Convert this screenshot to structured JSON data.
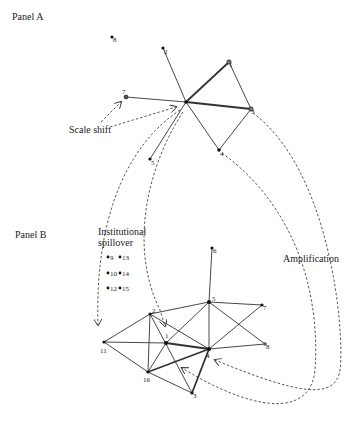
{
  "panels": {
    "a": {
      "label": "Panel A"
    },
    "b": {
      "label": "Panel B"
    }
  },
  "annotations": {
    "scale_shift": "Scale shift",
    "institutional_spillover_line1": "Institutional",
    "institutional_spillover_line2": "spillover",
    "amplification": "Amplification"
  },
  "panel_a": {
    "nodes": [
      {
        "id": "hub",
        "label": "",
        "x": 186,
        "y": 102
      },
      {
        "id": "8",
        "label": "8",
        "x": 112,
        "y": 37
      },
      {
        "id": "2",
        "label": "2",
        "x": 163,
        "y": 48
      },
      {
        "id": "7",
        "label": "7",
        "x": 126,
        "y": 97
      },
      {
        "id": "1",
        "label": "1",
        "x": 229,
        "y": 62
      },
      {
        "id": "3",
        "label": "3",
        "x": 251,
        "y": 109
      },
      {
        "id": "4",
        "label": "4",
        "x": 219,
        "y": 150
      },
      {
        "id": "5",
        "label": "5",
        "x": 150,
        "y": 159
      }
    ],
    "edges": [
      {
        "from": "hub",
        "to": "2",
        "weight": 1
      },
      {
        "from": "hub",
        "to": "7",
        "weight": 1
      },
      {
        "from": "hub",
        "to": "1",
        "weight": 2
      },
      {
        "from": "hub",
        "to": "3",
        "weight": 2.2
      },
      {
        "from": "hub",
        "to": "4",
        "weight": 1
      },
      {
        "from": "hub",
        "to": "5",
        "weight": 1
      },
      {
        "from": "1",
        "to": "3",
        "weight": 1
      },
      {
        "from": "3",
        "to": "4",
        "weight": 1
      }
    ]
  },
  "panel_b": {
    "isolated_nodes": [
      {
        "id": "9",
        "label": "9",
        "x": 108,
        "y": 257
      },
      {
        "id": "13",
        "label": "13",
        "x": 120,
        "y": 257
      },
      {
        "id": "10",
        "label": "10",
        "x": 108,
        "y": 273
      },
      {
        "id": "14",
        "label": "14",
        "x": 120,
        "y": 273
      },
      {
        "id": "12",
        "label": "12",
        "x": 108,
        "y": 288
      },
      {
        "id": "15",
        "label": "15",
        "x": 120,
        "y": 288
      }
    ],
    "nodes": [
      {
        "id": "6",
        "label": "6",
        "x": 212,
        "y": 248
      },
      {
        "id": "5",
        "label": "5",
        "x": 209,
        "y": 302
      },
      {
        "id": "7",
        "label": "7",
        "x": 262,
        "y": 305
      },
      {
        "id": "2",
        "label": "2",
        "x": 150,
        "y": 314
      },
      {
        "id": "1",
        "label": "1",
        "x": 166,
        "y": 343
      },
      {
        "id": "11",
        "label": "11",
        "x": 104,
        "y": 342
      },
      {
        "id": "4",
        "label": "4",
        "x": 209,
        "y": 349
      },
      {
        "id": "8",
        "label": "8",
        "x": 265,
        "y": 344
      },
      {
        "id": "16",
        "label": "16",
        "x": 148,
        "y": 372
      },
      {
        "id": "3",
        "label": "3",
        "x": 192,
        "y": 393
      }
    ],
    "edges": [
      {
        "from": "6",
        "to": "5",
        "weight": 1
      },
      {
        "from": "5",
        "to": "7",
        "weight": 1
      },
      {
        "from": "5",
        "to": "8",
        "weight": 1
      },
      {
        "from": "5",
        "to": "2",
        "weight": 1
      },
      {
        "from": "5",
        "to": "1",
        "weight": 1
      },
      {
        "from": "5",
        "to": "4",
        "weight": 1
      },
      {
        "from": "7",
        "to": "4",
        "weight": 1
      },
      {
        "from": "8",
        "to": "4",
        "weight": 1
      },
      {
        "from": "2",
        "to": "11",
        "weight": 1
      },
      {
        "from": "2",
        "to": "16",
        "weight": 1
      },
      {
        "from": "2",
        "to": "3",
        "weight": 1
      },
      {
        "from": "2",
        "to": "4",
        "weight": 1
      },
      {
        "from": "11",
        "to": "1",
        "weight": 1
      },
      {
        "from": "11",
        "to": "16",
        "weight": 1
      },
      {
        "from": "1",
        "to": "4",
        "weight": 2
      },
      {
        "from": "1",
        "to": "16",
        "weight": 1
      },
      {
        "from": "16",
        "to": "4",
        "weight": 1.8
      },
      {
        "from": "16",
        "to": "3",
        "weight": 1
      },
      {
        "from": "4",
        "to": "3",
        "weight": 2
      }
    ]
  }
}
